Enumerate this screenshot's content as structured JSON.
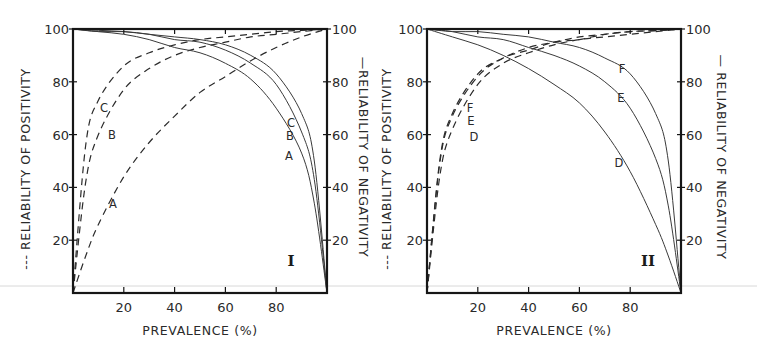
{
  "chart_data": [
    {
      "type": "line",
      "panel": "I",
      "xlabel": "PREVALENCE (%)",
      "ylabel_left": "--- RELIABILITY OF POSITIVITY",
      "ylabel_right": "— RELIABILITY OF NEGATIVITY",
      "x_ticks": [
        20,
        40,
        60,
        80
      ],
      "y_ticks": [
        20,
        40,
        60,
        80,
        100
      ],
      "xlim": [
        0,
        100
      ],
      "ylim": [
        0,
        100
      ],
      "grid": false,
      "series": [
        {
          "name": "A",
          "style": "dashed",
          "measure": "reliability of positivity",
          "sensitivity": 0.93,
          "specificity": 0.7,
          "points": [
            [
              0,
              0
            ],
            [
              5,
              14
            ],
            [
              10,
              26
            ],
            [
              20,
              44
            ],
            [
              30,
              57
            ],
            [
              40,
              67
            ],
            [
              50,
              76
            ],
            [
              60,
              82
            ],
            [
              70,
              88
            ],
            [
              80,
              93
            ],
            [
              90,
              97
            ],
            [
              100,
              100
            ]
          ]
        },
        {
          "name": "B",
          "style": "dashed",
          "measure": "reliability of positivity",
          "sensitivity": 0.95,
          "specificity": 0.93,
          "points": [
            [
              0,
              0
            ],
            [
              5,
              42
            ],
            [
              10,
              60
            ],
            [
              20,
              77
            ],
            [
              30,
              85
            ],
            [
              40,
              90
            ],
            [
              50,
              93
            ],
            [
              60,
              95
            ],
            [
              70,
              97
            ],
            [
              80,
              98
            ],
            [
              90,
              99
            ],
            [
              100,
              100
            ]
          ]
        },
        {
          "name": "C",
          "style": "dashed",
          "measure": "reliability of positivity",
          "sensitivity": 0.96,
          "specificity": 0.96,
          "points": [
            [
              0,
              0
            ],
            [
              5,
              56
            ],
            [
              10,
              73
            ],
            [
              20,
              86
            ],
            [
              30,
              91
            ],
            [
              40,
              94
            ],
            [
              50,
              96
            ],
            [
              60,
              97
            ],
            [
              70,
              98
            ],
            [
              80,
              99
            ],
            [
              90,
              99.5
            ],
            [
              100,
              100
            ]
          ]
        },
        {
          "name": "A",
          "style": "solid",
          "measure": "reliability of negativity",
          "sensitivity": 0.93,
          "specificity": 0.7,
          "points": [
            [
              0,
              100
            ],
            [
              10,
              99
            ],
            [
              20,
              98
            ],
            [
              30,
              96
            ],
            [
              40,
              93
            ],
            [
              50,
              91
            ],
            [
              60,
              87
            ],
            [
              70,
              81
            ],
            [
              80,
              70
            ],
            [
              90,
              53
            ],
            [
              95,
              34
            ],
            [
              100,
              0
            ]
          ]
        },
        {
          "name": "B",
          "style": "solid",
          "measure": "reliability of negativity",
          "sensitivity": 0.95,
          "specificity": 0.93,
          "points": [
            [
              0,
              100
            ],
            [
              10,
              99
            ],
            [
              20,
              99
            ],
            [
              30,
              98
            ],
            [
              40,
              96
            ],
            [
              50,
              95
            ],
            [
              60,
              92
            ],
            [
              70,
              87
            ],
            [
              80,
              79
            ],
            [
              90,
              61
            ],
            [
              95,
              43
            ],
            [
              100,
              0
            ]
          ]
        },
        {
          "name": "C",
          "style": "solid",
          "measure": "reliability of negativity",
          "sensitivity": 0.96,
          "specificity": 0.96,
          "points": [
            [
              0,
              100
            ],
            [
              10,
              99.5
            ],
            [
              20,
              99
            ],
            [
              30,
              98
            ],
            [
              40,
              97
            ],
            [
              50,
              96
            ],
            [
              60,
              94
            ],
            [
              70,
              90
            ],
            [
              80,
              83
            ],
            [
              90,
              68
            ],
            [
              95,
              50
            ],
            [
              100,
              0
            ]
          ]
        }
      ],
      "annotations": [
        "A",
        "B",
        "C",
        "I"
      ]
    },
    {
      "type": "line",
      "panel": "II",
      "xlabel": "PREVALENCE (%)",
      "ylabel_left": "--- RELIABILITY OF POSITIVITY",
      "ylabel_right": "— RELIABILITY OF NEGATIVITY",
      "x_ticks": [
        20,
        40,
        60,
        80
      ],
      "y_ticks": [
        20,
        40,
        60,
        80,
        100
      ],
      "xlim": [
        0,
        100
      ],
      "ylim": [
        0,
        100
      ],
      "grid": false,
      "series": [
        {
          "name": "D",
          "style": "dashed",
          "measure": "reliability of positivity",
          "sensitivity": 0.75,
          "specificity": 0.95,
          "points": [
            [
              0,
              0
            ],
            [
              5,
              44
            ],
            [
              10,
              62
            ],
            [
              20,
              79
            ],
            [
              30,
              87
            ],
            [
              40,
              91
            ],
            [
              50,
              94
            ],
            [
              60,
              96
            ],
            [
              70,
              97
            ],
            [
              80,
              98
            ],
            [
              90,
              99
            ],
            [
              100,
              100
            ]
          ]
        },
        {
          "name": "E",
          "style": "dashed",
          "measure": "reliability of positivity",
          "sensitivity": 0.9,
          "specificity": 0.95,
          "points": [
            [
              0,
              0
            ],
            [
              5,
              49
            ],
            [
              10,
              67
            ],
            [
              20,
              82
            ],
            [
              30,
              89
            ],
            [
              40,
              92
            ],
            [
              50,
              95
            ],
            [
              60,
              96
            ],
            [
              70,
              98
            ],
            [
              80,
              99
            ],
            [
              90,
              99.4
            ],
            [
              100,
              100
            ]
          ]
        },
        {
          "name": "F",
          "style": "dashed",
          "measure": "reliability of positivity",
          "sensitivity": 0.95,
          "specificity": 0.95,
          "points": [
            [
              0,
              0
            ],
            [
              5,
              50
            ],
            [
              10,
              68
            ],
            [
              20,
              83
            ],
            [
              30,
              89
            ],
            [
              40,
              93
            ],
            [
              50,
              95
            ],
            [
              60,
              97
            ],
            [
              70,
              98
            ],
            [
              80,
              99
            ],
            [
              90,
              99.4
            ],
            [
              100,
              100
            ]
          ]
        },
        {
          "name": "D",
          "style": "solid",
          "measure": "reliability of negativity",
          "sensitivity": 0.75,
          "specificity": 0.95,
          "points": [
            [
              0,
              100
            ],
            [
              10,
              97
            ],
            [
              20,
              94
            ],
            [
              30,
              90
            ],
            [
              40,
              85
            ],
            [
              50,
              79
            ],
            [
              60,
              72
            ],
            [
              70,
              61
            ],
            [
              80,
              46
            ],
            [
              90,
              26
            ],
            [
              95,
              14
            ],
            [
              100,
              0
            ]
          ]
        },
        {
          "name": "E",
          "style": "solid",
          "measure": "reliability of negativity",
          "sensitivity": 0.9,
          "specificity": 0.95,
          "points": [
            [
              0,
              100
            ],
            [
              10,
              99
            ],
            [
              20,
              97
            ],
            [
              30,
              96
            ],
            [
              40,
              93
            ],
            [
              50,
              90
            ],
            [
              60,
              86
            ],
            [
              70,
              80
            ],
            [
              80,
              70
            ],
            [
              90,
              51
            ],
            [
              95,
              33
            ],
            [
              100,
              0
            ]
          ]
        },
        {
          "name": "F",
          "style": "solid",
          "measure": "reliability of negativity",
          "sensitivity": 0.95,
          "specificity": 0.95,
          "points": [
            [
              0,
              100
            ],
            [
              10,
              99
            ],
            [
              20,
              99
            ],
            [
              30,
              98
            ],
            [
              40,
              97
            ],
            [
              50,
              95
            ],
            [
              60,
              93
            ],
            [
              70,
              89
            ],
            [
              80,
              83
            ],
            [
              90,
              68
            ],
            [
              95,
              50
            ],
            [
              100,
              0
            ]
          ]
        }
      ],
      "annotations": [
        "D",
        "E",
        "F",
        "II"
      ]
    }
  ],
  "panels": [
    {
      "id": "I",
      "box": {
        "x": 73,
        "y": 29,
        "w": 254,
        "h": 264
      },
      "panel_label": "I",
      "panel_label_pos": [
        291,
        266
      ],
      "left_title": "--- RELIABILITY OF POSITIVITY",
      "right_title": "—RELIABILITY OF NEGATIVITY",
      "left_title_x": 30,
      "right_title_x": 359,
      "x_title": "PREVALENCE (%)",
      "curve_labels": [
        {
          "text": "C",
          "x": 104,
          "y": 112
        },
        {
          "text": "B",
          "x": 112,
          "y": 139
        },
        {
          "text": "A",
          "x": 113,
          "y": 208
        },
        {
          "text": "C",
          "x": 291,
          "y": 127
        },
        {
          "text": "B",
          "x": 290,
          "y": 140
        },
        {
          "text": "A",
          "x": 289,
          "y": 160
        }
      ]
    },
    {
      "id": "II",
      "box": {
        "x": 427,
        "y": 29,
        "w": 254,
        "h": 264
      },
      "panel_label": "II",
      "panel_label_pos": [
        648,
        266
      ],
      "left_title": "--- RELIABILITY OF POSITIVITY",
      "right_title": "— RELIABILITY OF NEGATIVITY",
      "left_title_x": 391,
      "right_title_x": 717,
      "x_title": "PREVALENCE (%)",
      "curve_labels": [
        {
          "text": "F",
          "x": 470,
          "y": 112
        },
        {
          "text": "E",
          "x": 471,
          "y": 125
        },
        {
          "text": "D",
          "x": 474,
          "y": 141
        },
        {
          "text": "F",
          "x": 622,
          "y": 73
        },
        {
          "text": "E",
          "x": 621,
          "y": 102
        },
        {
          "text": "D",
          "x": 619,
          "y": 167
        }
      ]
    }
  ]
}
